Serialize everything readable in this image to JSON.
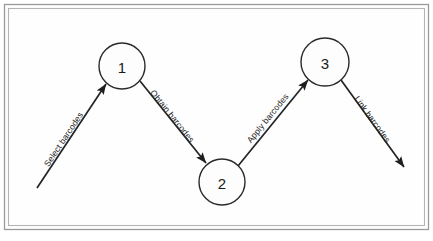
{
  "figure": {
    "background_color": "#ffffff",
    "frame_color": "#9a9a9a",
    "stroke_color": "#232323"
  },
  "nodes": [
    {
      "id": "node-1",
      "label": "1",
      "cx": 122,
      "cy": 66,
      "r": 23
    },
    {
      "id": "node-2",
      "label": "2",
      "cx": 222,
      "cy": 182,
      "r": 23
    },
    {
      "id": "node-3",
      "label": "3",
      "cx": 325,
      "cy": 62,
      "r": 24
    }
  ],
  "edges": [
    {
      "id": "edge-select",
      "label": "Select barcodes",
      "from": "start",
      "to": "node-1",
      "x1": 37,
      "y1": 188,
      "x2": 106,
      "y2": 84,
      "angle": -56.4,
      "label_x": 66,
      "label_y": 141
    },
    {
      "id": "edge-obtain",
      "label": "Obtain barcodes",
      "from": "node-1",
      "to": "node-2",
      "x1": 140,
      "y1": 81,
      "x2": 206,
      "y2": 163,
      "angle": 51.2,
      "label_x": 170,
      "label_y": 118
    },
    {
      "id": "edge-apply",
      "label": "Apply barcodes",
      "from": "node-2",
      "to": "node-3",
      "x1": 238,
      "y1": 166,
      "x2": 308,
      "y2": 80,
      "angle": -50.9,
      "label_x": 270,
      "label_y": 120
    },
    {
      "id": "edge-link",
      "label": "Link barcodes",
      "from": "node-3",
      "to": "end",
      "x1": 341,
      "y1": 80,
      "x2": 404,
      "y2": 167,
      "angle": 54.1,
      "label_x": 370,
      "label_y": 121
    }
  ],
  "frame": {
    "outer": {
      "x": 4.5,
      "y": 4.5,
      "width": 424,
      "height": 225
    },
    "inner": {
      "x": 8.5,
      "y": 8.5,
      "width": 416,
      "height": 217
    }
  }
}
